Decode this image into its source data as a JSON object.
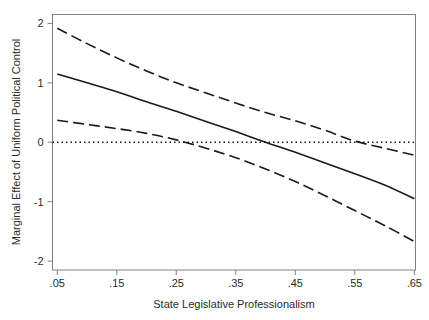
{
  "figure": {
    "background_color": "#ffffff",
    "line_color": "#1a1a1a",
    "frame_color": "#808080",
    "text_color": "#2b2b2b"
  },
  "chart_data": {
    "type": "line",
    "title": "",
    "subtitle": "",
    "xlabel": "State Legislative Professionalism",
    "ylabel": "Marginal Effect of Uniform Political Control",
    "xlim": [
      0.042,
      0.652
    ],
    "ylim": [
      -2.15,
      2.15
    ],
    "xticks": [
      0.05,
      0.15,
      0.25,
      0.35,
      0.45,
      0.55,
      0.65
    ],
    "xticklabels": [
      ".05",
      ".15",
      ".25",
      ".35",
      ".45",
      ".55",
      ".65"
    ],
    "yticks": [
      -2,
      -1,
      0,
      1,
      2
    ],
    "yticklabels": [
      "-2",
      "-1",
      "0",
      "1",
      "2"
    ],
    "grid": false,
    "legend": null,
    "legend_position": "none",
    "annotations": [],
    "x": [
      0.05,
      0.1,
      0.15,
      0.2,
      0.25,
      0.3,
      0.35,
      0.4,
      0.45,
      0.5,
      0.55,
      0.6,
      0.65
    ],
    "series": [
      {
        "name": "Marginal effect",
        "style": "solid",
        "values": [
          1.15,
          1.0,
          0.85,
          0.68,
          0.52,
          0.35,
          0.18,
          0.0,
          -0.17,
          -0.35,
          -0.53,
          -0.72,
          -0.95
        ]
      },
      {
        "name": "Upper 95% confidence bound",
        "style": "dashed",
        "values": [
          1.92,
          1.66,
          1.42,
          1.2,
          1.0,
          0.83,
          0.66,
          0.5,
          0.36,
          0.2,
          0.02,
          -0.1,
          -0.22
        ]
      },
      {
        "name": "Lower 95% confidence bound",
        "style": "dashed",
        "values": [
          0.37,
          0.3,
          0.23,
          0.15,
          0.04,
          -0.1,
          -0.26,
          -0.45,
          -0.66,
          -0.9,
          -1.15,
          -1.4,
          -1.67
        ]
      }
    ],
    "reference_line": {
      "name": "zero-reference-line",
      "orientation": "horizontal",
      "value": 0,
      "style": "dotted"
    }
  }
}
